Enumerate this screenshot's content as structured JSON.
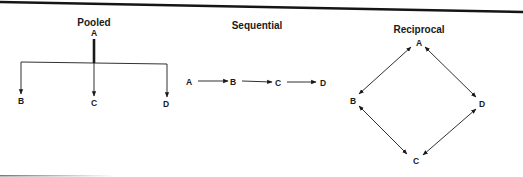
{
  "colors": {
    "ink": "#1a1a1a",
    "border": "#151515",
    "background": "#ffffff"
  },
  "diagrams": {
    "pooled": {
      "title": "Pooled",
      "nodes": {
        "a": "A",
        "b": "B",
        "c": "C",
        "d": "D"
      },
      "edges": [
        {
          "from": "A",
          "to": "B",
          "type": "one-way"
        },
        {
          "from": "A",
          "to": "C",
          "type": "one-way"
        },
        {
          "from": "A",
          "to": "D",
          "type": "one-way"
        }
      ]
    },
    "sequential": {
      "title": "Sequential",
      "nodes": {
        "a": "A",
        "b": "B",
        "c": "C",
        "d": "D"
      },
      "edges": [
        {
          "from": "A",
          "to": "B",
          "type": "one-way"
        },
        {
          "from": "B",
          "to": "C",
          "type": "one-way"
        },
        {
          "from": "C",
          "to": "D",
          "type": "one-way"
        }
      ]
    },
    "reciprocal": {
      "title": "Reciprocal",
      "nodes": {
        "a": "A",
        "b": "B",
        "c": "C",
        "d": "D"
      },
      "edges": [
        {
          "from": "A",
          "to": "B",
          "type": "two-way"
        },
        {
          "from": "A",
          "to": "D",
          "type": "two-way"
        },
        {
          "from": "B",
          "to": "C",
          "type": "two-way"
        },
        {
          "from": "C",
          "to": "D",
          "type": "two-way"
        }
      ]
    }
  }
}
